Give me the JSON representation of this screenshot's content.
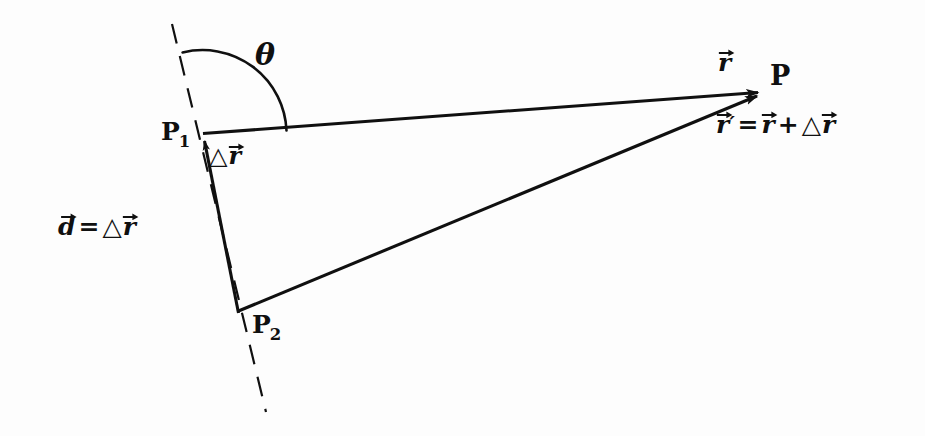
{
  "figure": {
    "kind": "vector-diagram",
    "background_color": "#fdfdfd",
    "ink_color": "#101010"
  },
  "points": {
    "p1": {
      "label_letter": "P",
      "label_sub": "1",
      "x": 203,
      "y": 135
    },
    "p2": {
      "label_letter": "P",
      "label_sub": "2",
      "x": 238,
      "y": 313
    },
    "p": {
      "label": "P",
      "x": 765,
      "y": 92
    }
  },
  "labels": {
    "theta": "θ",
    "vector_r": "r",
    "vector_r_prime_letter": "r",
    "prime_mark": "′",
    "delta_symbol": "△",
    "equals": "=",
    "plus": "+",
    "vector_d": "d"
  },
  "annotations": {
    "angle_label": "θ",
    "r_label": "r⃗",
    "delta_r_label": "△r⃗",
    "equation": "r⃗′ = r⃗ + △r⃗",
    "d_equation": "d⃗ = △r⃗",
    "point_p": "P",
    "point_p1": "P₁",
    "point_p2": "P₂"
  },
  "geometry": {
    "vector_r_from_p1_to_p": {
      "x1": 203,
      "y1": 133,
      "x2": 765,
      "y2": 92
    },
    "vector_r_prime_from_p2_to_p": {
      "x1": 238,
      "y1": 311,
      "x2": 765,
      "y2": 95
    },
    "vector_delta_r_from_p2_to_p1": {
      "x1": 238,
      "y1": 313,
      "x2": 204,
      "y2": 137
    },
    "dashed_axis": {
      "x1": 172,
      "y1": 24,
      "x2": 266,
      "y2": 412
    },
    "angle_arc": {
      "center_x": 203,
      "center_y": 134,
      "radius": 84,
      "start_deg": 104,
      "end_deg": 4
    }
  }
}
